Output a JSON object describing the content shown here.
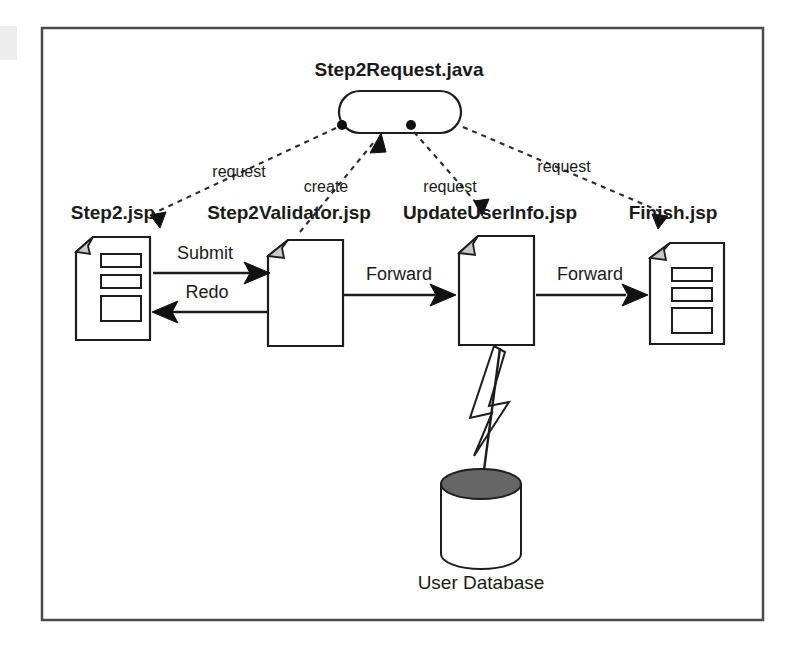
{
  "diagram": {
    "object": {
      "name": "Step2Request.java",
      "shape": "rounded-rectangle"
    },
    "pages": [
      {
        "id": "step2",
        "label": "Step2.jsp",
        "has_form_fields": true
      },
      {
        "id": "validator",
        "label": "Step2Validator.jsp",
        "has_form_fields": false
      },
      {
        "id": "update",
        "label": "UpdateUserInfo.jsp",
        "has_form_fields": false
      },
      {
        "id": "finish",
        "label": "Finish.jsp",
        "has_form_fields": true
      }
    ],
    "flows": [
      {
        "id": "submit",
        "label": "Submit",
        "from": "step2",
        "to": "validator",
        "direction": "right"
      },
      {
        "id": "redo",
        "label": "Redo",
        "from": "validator",
        "to": "step2",
        "direction": "left"
      },
      {
        "id": "forward1",
        "label": "Forward",
        "from": "validator",
        "to": "update",
        "direction": "right"
      },
      {
        "id": "forward2",
        "label": "Forward",
        "from": "update",
        "to": "finish",
        "direction": "right"
      }
    ],
    "dependencies": [
      {
        "id": "dep-step2",
        "label": "request",
        "from": "step2",
        "to": "object"
      },
      {
        "id": "dep-validator",
        "label": "create",
        "from": "validator",
        "to": "object"
      },
      {
        "id": "dep-update",
        "label": "request",
        "from": "update",
        "to": "object"
      },
      {
        "id": "dep-finish",
        "label": "request",
        "from": "finish",
        "to": "object"
      }
    ],
    "datastore": {
      "label": "User Database",
      "shape": "cylinder",
      "linked_from": "update",
      "link_style": "lightning-bolt"
    },
    "colors": {
      "line": "#1d1d1d",
      "text": "#1a1a1a",
      "fold_fill": "#c9c9c9",
      "db_top_fill": "#666666",
      "frame": "#4a4a4a",
      "background": "#ffffff"
    }
  }
}
